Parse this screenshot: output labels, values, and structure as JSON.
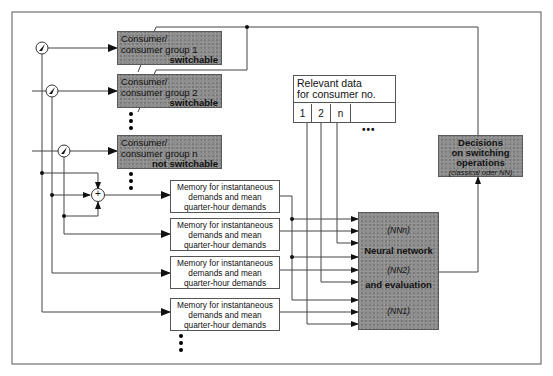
{
  "diagram": {
    "consumers": [
      {
        "line1": "Consumer/",
        "line2": "consumer group 1",
        "status": "switchable"
      },
      {
        "line1": "Consumer/",
        "line2": "consumer group 2",
        "status": "switchable"
      },
      {
        "line1": "Consumer/",
        "line2": "consumer group n",
        "status": "not switchable"
      }
    ],
    "memory_blocks": [
      {
        "line1": "Memory for instantaneous",
        "line2": "demands and mean",
        "line3": "quarter-hour demands"
      },
      {
        "line1": "Memory for instantaneous",
        "line2": "demands and mean",
        "line3": "quarter-hour demands"
      },
      {
        "line1": "Memory for instantaneous",
        "line2": "demands and mean",
        "line3": "quarter-hour demands"
      },
      {
        "line1": "Memory for instantaneous",
        "line2": "demands and mean",
        "line3": "quarter-hour demands"
      }
    ],
    "relevant_data": {
      "header_line1": "Relevant data",
      "header_line2": "for consumer no.",
      "cells": [
        "1",
        "2",
        "n",
        ""
      ],
      "continuation": "•••"
    },
    "neural_network": {
      "nnn": "(NNn)",
      "title_line1": "Neural network",
      "nn2": "(NN2)",
      "title_line2": "and evaluation",
      "nn1": "(NN1)"
    },
    "decisions": {
      "line1": "Decisions",
      "line2": "on switching",
      "line3": "operations",
      "line4": "(classical oder NN)"
    },
    "summing_junction": "+",
    "colors": {
      "shaded_block": "#8e8e8e",
      "line": "#444444",
      "background": "#ffffff"
    }
  }
}
